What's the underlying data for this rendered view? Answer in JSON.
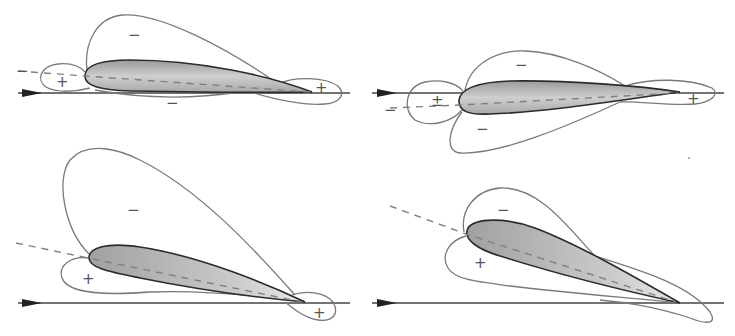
{
  "figure": {
    "colors": {
      "background": "#ffffff",
      "envelope_line": "#7a7a7a",
      "airfoil_outline": "#2b2b2b",
      "airfoil_fill_light": "#ececec",
      "airfoil_fill_dark": "#9a9a9a",
      "chord_dashed": "#808080",
      "flow_arrow": "#222222"
    },
    "panels": [
      {
        "id": "top-left",
        "airfoil_orientation": "slight positive incidence, chord tilted down toward trailing edge",
        "labels": [
          {
            "sign": "−",
            "region": "upper suction lobe"
          },
          {
            "sign": "−",
            "region": "left of leading edge (on dashed chord extension)"
          },
          {
            "sign": "+",
            "region": "leading edge stagnation lobe"
          },
          {
            "sign": "−",
            "region": "lower surface"
          },
          {
            "sign": "+",
            "region": "trailing edge lobe"
          }
        ]
      },
      {
        "id": "top-right",
        "airfoil_orientation": "negative incidence, chord below flow line",
        "labels": [
          {
            "sign": "−",
            "region": "upper suction lobe"
          },
          {
            "sign": "−",
            "region": "left of leading edge (on dashed chord extension)"
          },
          {
            "sign": "±",
            "region": "leading edge lobe"
          },
          {
            "sign": "−",
            "region": "lower suction lobe"
          },
          {
            "sign": "+",
            "region": "trailing edge lobe"
          }
        ]
      },
      {
        "id": "bottom-left",
        "airfoil_orientation": "moderate angle of attack",
        "labels": [
          {
            "sign": "−",
            "region": "large upper suction lobe"
          },
          {
            "sign": "+",
            "region": "lower pressure lobe"
          },
          {
            "sign": "+",
            "region": "trailing edge lobe"
          }
        ]
      },
      {
        "id": "bottom-right",
        "airfoil_orientation": "high angle of attack",
        "labels": [
          {
            "sign": "−",
            "region": "upper suction lobe"
          },
          {
            "sign": "+",
            "region": "lower pressure lobe"
          }
        ]
      }
    ]
  },
  "signs": {
    "tl_minus_top": "−",
    "tl_minus_left": "−",
    "tl_plus_le": "+",
    "tl_minus_bottom": "−",
    "tl_plus_te": "+",
    "tr_minus_top": "−",
    "tr_minus_left": "−",
    "tr_pm_le": "±",
    "tr_minus_bottom": "−",
    "tr_plus_te": "+",
    "bl_minus_top": "−",
    "bl_plus_lower": "+",
    "bl_plus_te": "+",
    "br_minus_top": "−",
    "br_plus_lower": "+"
  }
}
